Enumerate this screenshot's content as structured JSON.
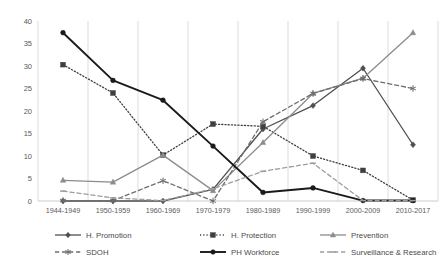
{
  "chart_data": {
    "type": "line",
    "title": "",
    "xlabel": "",
    "ylabel": "",
    "ylim": [
      0,
      40
    ],
    "ytick_step": 5,
    "grid": "vertical",
    "legend_position": "bottom",
    "categories": [
      "1944-1949",
      "1950-1959",
      "1960-1969",
      "1970-1979",
      "1980-1989",
      "1990-1999",
      "2000-2009",
      "2010-2017"
    ],
    "yticks": [
      "0",
      "5",
      "10",
      "15",
      "20",
      "25",
      "30",
      "35",
      "40"
    ],
    "series": [
      {
        "name": "H. Promotion",
        "color": "#4f4f4f",
        "dash": "none",
        "marker": "diamond",
        "width": 1.3,
        "values": [
          0,
          0,
          0,
          2.6,
          16.0,
          21.2,
          29.5,
          12.5
        ]
      },
      {
        "name": "H. Protection",
        "color": "#3f3f3f",
        "dash": "dotted",
        "marker": "square",
        "width": 1.3,
        "values": [
          30.3,
          24.0,
          10.2,
          17.1,
          16.6,
          10.0,
          6.8,
          0.2
        ]
      },
      {
        "name": "Prevention",
        "color": "#8c8c8c",
        "dash": "none",
        "marker": "triangle",
        "width": 1.3,
        "values": [
          4.6,
          4.2,
          10.2,
          2.3,
          13.0,
          23.9,
          27.3,
          37.4
        ]
      },
      {
        "name": "SDOH",
        "color": "#6e6e6e",
        "dash": "dashed",
        "marker": "asterisk",
        "width": 1.3,
        "values": [
          0.1,
          0.1,
          4.5,
          0.0,
          17.6,
          23.9,
          27.2,
          25.0
        ]
      },
      {
        "name": "PH Workforce",
        "color": "#1a1a1a",
        "dash": "none",
        "marker": "circle",
        "width": 1.9,
        "values": [
          37.4,
          26.8,
          22.4,
          12.2,
          1.9,
          2.9,
          0.1,
          0.1
        ]
      },
      {
        "name": "Surveillance & Research",
        "color": "#9e9e9e",
        "dash": "dashed",
        "marker": "dash",
        "width": 1.3,
        "values": [
          2.2,
          0.7,
          0.1,
          2.7,
          6.6,
          8.4,
          0.1,
          0.1
        ]
      }
    ]
  }
}
